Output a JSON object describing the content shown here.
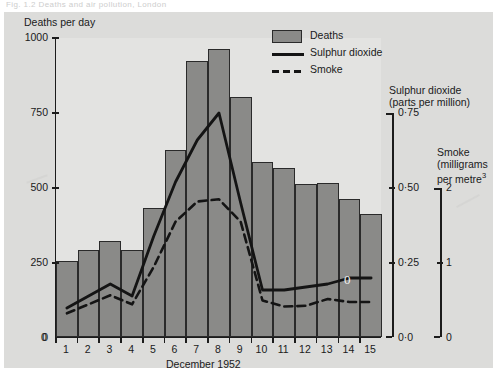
{
  "caption": "Fig. 1.2   Deaths and air pollution, London",
  "legend": {
    "items": [
      {
        "label": "Deaths",
        "marker": "filled-rect",
        "color": "#8a8a88"
      },
      {
        "label": "Sulphur dioxide",
        "marker": "solid-line",
        "color": "#141414"
      },
      {
        "label": "Smoke",
        "marker": "dashed-line",
        "color": "#141414"
      }
    ]
  },
  "axes": {
    "left": {
      "title": "Deaths per day",
      "ticks": [
        "1000",
        "750",
        "500",
        "250",
        "0"
      ]
    },
    "sulphur": {
      "title_line1": "Sulphur dioxide",
      "title_line2": "(parts per million)",
      "ticks": [
        "0·75",
        "0·50",
        "0·25",
        "0·0"
      ]
    },
    "smoke": {
      "title_line1": "Smoke",
      "title_line2": "(milligrams",
      "title_line3": "per metre",
      "title_superscript": "3",
      "ticks": [
        "2",
        "1",
        "0"
      ]
    },
    "x": {
      "title": "December 1952",
      "ticks": [
        "1",
        "2",
        "3",
        "4",
        "5",
        "6",
        "7",
        "8",
        "9",
        "10",
        "11",
        "12",
        "13",
        "14",
        "15"
      ]
    }
  },
  "annotations": {
    "pen_mark": "0"
  },
  "chart_data": {
    "type": "bar",
    "title": "Deaths per day",
    "xlabel": "December 1952",
    "ylabel": "Deaths per day",
    "categories": [
      "1",
      "2",
      "3",
      "4",
      "5",
      "6",
      "7",
      "8",
      "9",
      "10",
      "11",
      "12",
      "13",
      "14",
      "15"
    ],
    "grid": false,
    "legend_position": "top-right",
    "ylim": [
      0,
      1000
    ],
    "series": [
      {
        "name": "Deaths",
        "type": "bar",
        "axis": "left",
        "unit": "deaths per day",
        "color": "#8a8a88",
        "values": [
          255,
          290,
          320,
          290,
          430,
          625,
          920,
          960,
          800,
          585,
          565,
          510,
          515,
          460,
          410
        ]
      },
      {
        "name": "Sulphur dioxide",
        "type": "line",
        "axis": "sulphur",
        "unit": "parts per million",
        "color": "#141414",
        "ylim": [
          0,
          0.75
        ],
        "values": [
          0.1,
          0.14,
          0.18,
          0.14,
          0.34,
          0.52,
          0.66,
          0.75,
          0.45,
          0.16,
          0.16,
          0.17,
          0.18,
          0.2,
          0.2
        ]
      },
      {
        "name": "Smoke",
        "type": "line-dashed",
        "axis": "smoke",
        "unit": "milligrams per metre^3",
        "color": "#141414",
        "ylim": [
          0,
          2
        ],
        "values": [
          0.33,
          0.45,
          0.57,
          0.45,
          0.95,
          1.55,
          1.82,
          1.85,
          1.55,
          0.5,
          0.42,
          0.43,
          0.52,
          0.48,
          0.48
        ]
      }
    ]
  }
}
